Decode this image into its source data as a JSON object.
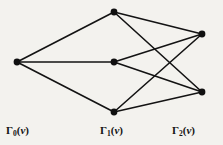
{
  "figure": {
    "type": "graph-diagram",
    "background_color": "#f3f2ee",
    "ink_color": "#101010",
    "width": 223,
    "height": 145
  },
  "labels": [
    {
      "id": "g0",
      "gamma": "Γ",
      "index": "0",
      "open": "(",
      "var": "v",
      "close": ")",
      "full_text": "Γ0(v)"
    },
    {
      "id": "g1",
      "gamma": "Γ",
      "index": "1",
      "open": "(",
      "var": "v",
      "close": ")",
      "full_text": "Γ1(v)"
    },
    {
      "id": "g2",
      "gamma": "Γ",
      "index": "2",
      "open": "(",
      "var": "v",
      "close": ")",
      "full_text": "Γ2(v)"
    }
  ],
  "graph_data": {
    "type": "node-link",
    "description": "Distance partition of a graph about vertex v: one node in Gamma_0, three nodes in Gamma_1, two nodes in Gamma_2.",
    "node_radius": 3.4,
    "nodes": [
      {
        "id": "v",
        "layer": "g0",
        "x": 17,
        "y": 62
      },
      {
        "id": "a1",
        "layer": "g1",
        "x": 114,
        "y": 12
      },
      {
        "id": "a2",
        "layer": "g1",
        "x": 114,
        "y": 62
      },
      {
        "id": "a3",
        "layer": "g1",
        "x": 114,
        "y": 112
      },
      {
        "id": "b1",
        "layer": "g2",
        "x": 202,
        "y": 34
      },
      {
        "id": "b2",
        "layer": "g2",
        "x": 202,
        "y": 92
      }
    ],
    "edges": [
      {
        "from": "v",
        "to": "a1"
      },
      {
        "from": "v",
        "to": "a2"
      },
      {
        "from": "v",
        "to": "a3"
      },
      {
        "from": "a1",
        "to": "b1"
      },
      {
        "from": "a1",
        "to": "b2"
      },
      {
        "from": "a2",
        "to": "b1"
      },
      {
        "from": "a2",
        "to": "b2"
      },
      {
        "from": "a3",
        "to": "b1"
      },
      {
        "from": "a3",
        "to": "b2"
      }
    ],
    "layer_x": {
      "g0": 17,
      "g1": 114,
      "g2": 202
    }
  }
}
